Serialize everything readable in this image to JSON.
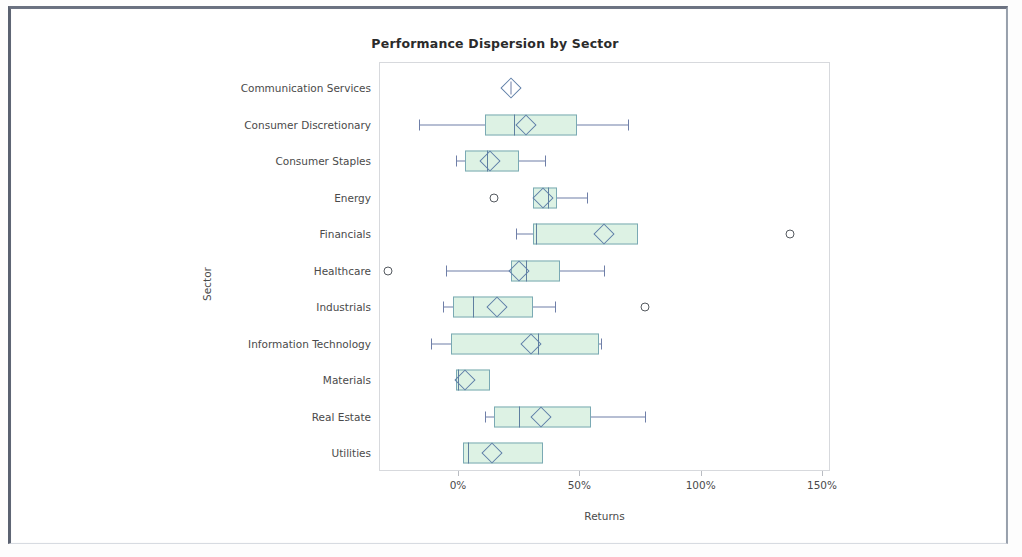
{
  "chart_data": {
    "type": "box",
    "title": "Performance Dispersion by Sector",
    "xlabel": "Returns",
    "ylabel": "Sector",
    "orientation": "horizontal",
    "xlim": [
      -35,
      155
    ],
    "xticks": [
      0,
      50,
      100,
      150
    ],
    "xtick_labels": [
      "0%",
      "50%",
      "100%",
      "150%"
    ],
    "grid": false,
    "legend": "none",
    "categories": [
      "Communication Services",
      "Consumer Discretionary",
      "Consumer Staples",
      "Energy",
      "Financials",
      "Healthcare",
      "Industrials",
      "Information Technology",
      "Materials",
      "Real Estate",
      "Utilities"
    ],
    "boxes": [
      {
        "category": "Communication Services",
        "whisker_low": 22,
        "q1": 22,
        "median": 22,
        "q3": 22,
        "whisker_high": 22,
        "mean": 22,
        "outliers": [],
        "single_point": true
      },
      {
        "category": "Consumer Discretionary",
        "whisker_low": -16,
        "q1": 11,
        "median": 23,
        "q3": 49,
        "whisker_high": 70,
        "mean": 28,
        "outliers": [],
        "single_point": false
      },
      {
        "category": "Consumer Staples",
        "whisker_low": -1,
        "q1": 3,
        "median": 12,
        "q3": 25,
        "whisker_high": 36,
        "mean": 13,
        "outliers": [],
        "single_point": false
      },
      {
        "category": "Energy",
        "whisker_low": 31,
        "q1": 31,
        "median": 37,
        "q3": 41,
        "whisker_high": 53,
        "mean": 35,
        "outliers": [
          15
        ],
        "single_point": false
      },
      {
        "category": "Financials",
        "whisker_low": 24,
        "q1": 31,
        "median": 32,
        "q3": 74,
        "whisker_high": 74,
        "mean": 60,
        "outliers": [
          137
        ],
        "single_point": false
      },
      {
        "category": "Healthcare",
        "whisker_low": -5,
        "q1": 22,
        "median": 28,
        "q3": 42,
        "whisker_high": 60,
        "mean": 25,
        "outliers": [
          -29
        ],
        "single_point": false
      },
      {
        "category": "Industrials",
        "whisker_low": -6,
        "q1": -2,
        "median": 6,
        "q3": 31,
        "whisker_high": 40,
        "mean": 16,
        "outliers": [
          77
        ],
        "single_point": false
      },
      {
        "category": "Information Technology",
        "whisker_low": -11,
        "q1": -3,
        "median": 33,
        "q3": 58,
        "whisker_high": 59,
        "mean": 30,
        "outliers": [],
        "single_point": false
      },
      {
        "category": "Materials",
        "whisker_low": -1,
        "q1": -1,
        "median": 0,
        "q3": 13,
        "whisker_high": 13,
        "mean": 3,
        "outliers": [],
        "single_point": false
      },
      {
        "category": "Real Estate",
        "whisker_low": 11,
        "q1": 15,
        "median": 25,
        "q3": 55,
        "whisker_high": 77,
        "mean": 34,
        "outliers": [],
        "single_point": false
      },
      {
        "category": "Utilities",
        "whisker_low": 2,
        "q1": 2,
        "median": 4,
        "q3": 35,
        "whisker_high": 35,
        "mean": 14,
        "outliers": [],
        "single_point": false
      }
    ],
    "colors": {
      "box_fill": "#ddf2e4",
      "box_edge": "#7aa9b4",
      "whisker": "#6f7fa8",
      "median": "#5f7fa0",
      "mean_marker": "#5f7fa8",
      "outlier": "#555a60",
      "text": "#4a4a4a",
      "title_text": "#2b2b2b",
      "plot_border": "#d7d9dd"
    }
  }
}
